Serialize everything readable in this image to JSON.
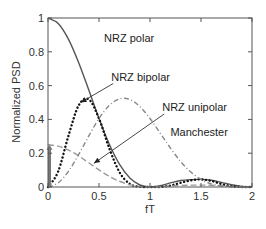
{
  "chart_data": {
    "type": "line",
    "title": "",
    "xlabel": "fT",
    "ylabel": "Normalized PSD",
    "xlim": [
      0,
      2
    ],
    "ylim": [
      0,
      1
    ],
    "grid": false,
    "legend_position": "none (inline annotations)",
    "x_ticks": [
      "0",
      "0.5",
      "1",
      "1.5",
      "2"
    ],
    "y_ticks": [
      "0",
      "0.2",
      "0.4",
      "0.6",
      "0.8",
      "1"
    ],
    "x": [
      0,
      0.1,
      0.2,
      0.3,
      0.4,
      0.5,
      0.6,
      0.7,
      0.8,
      0.9,
      1.0,
      1.1,
      1.2,
      1.3,
      1.4,
      1.5,
      1.6,
      1.7,
      1.8,
      1.9,
      2.0
    ],
    "series": [
      {
        "name": "NRZ polar",
        "style": "solid",
        "color": "#555555",
        "values": [
          1.0,
          0.9675,
          0.8751,
          0.7368,
          0.5733,
          0.4053,
          0.2546,
          0.1355,
          0.0547,
          0.0119,
          0.0,
          0.008,
          0.0243,
          0.0381,
          0.0435,
          0.045,
          0.0398,
          0.0275,
          0.0135,
          0.0033,
          0.0
        ]
      },
      {
        "name": "NRZ bipolar",
        "style": "dotted",
        "color": "#111111",
        "values": [
          0.0,
          0.0924,
          0.3023,
          0.4822,
          0.5186,
          0.4053,
          0.2303,
          0.0887,
          0.0189,
          0.0011,
          0.0,
          0.0008,
          0.0084,
          0.0249,
          0.0393,
          0.045,
          0.036,
          0.018,
          0.0047,
          0.0003,
          0.0
        ]
      },
      {
        "name": "NRZ unipolar",
        "style": "dashed",
        "color": "#999999",
        "impulse_at_0": 0.25,
        "values": [
          0.25,
          0.2419,
          0.2188,
          0.1842,
          0.1433,
          0.1013,
          0.0637,
          0.0339,
          0.0137,
          0.003,
          0.0,
          0.002,
          0.0061,
          0.0095,
          0.0109,
          0.0113,
          0.01,
          0.0069,
          0.0034,
          0.0008,
          0.0
        ]
      },
      {
        "name": "Manchester",
        "style": "dash-dot",
        "color": "#888888",
        "values": [
          0.0,
          0.0243,
          0.0924,
          0.1913,
          0.3023,
          0.4053,
          0.4822,
          0.5213,
          0.5182,
          0.4761,
          0.4053,
          0.3187,
          0.2303,
          0.1511,
          0.0886,
          0.045,
          0.0189,
          0.006,
          0.0011,
          0.0001,
          0.0
        ]
      }
    ],
    "annotations": [
      {
        "text": "NRZ polar",
        "x": 0.55,
        "y": 0.86
      },
      {
        "text": "NRZ bipolar",
        "x": 0.62,
        "y": 0.63,
        "arrow_to": [
          0.32,
          0.5
        ]
      },
      {
        "text": "NRZ unipolar",
        "x": 1.12,
        "y": 0.45,
        "arrow_to": [
          0.45,
          0.14
        ]
      },
      {
        "text": "Manchester",
        "x": 1.2,
        "y": 0.3
      }
    ]
  }
}
